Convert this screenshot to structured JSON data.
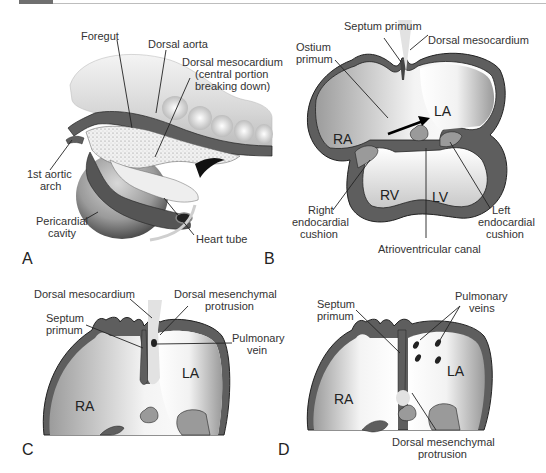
{
  "header": {
    "bar": "page-header-strip"
  },
  "colors": {
    "wall": "#5e5e5e",
    "wall_outline": "#222222",
    "cavity_light": "#ffffff",
    "cavity_shade": "#a8a8a8",
    "cushion": "#9a9a9a",
    "mesocardium": "#e2e2e2"
  },
  "panels": {
    "A": {
      "letter": "A",
      "labels": {
        "foregut": "Foregut",
        "dorsal_aorta": "Dorsal aorta",
        "dorsal_mesocardium_1": "Dorsal mesocardium",
        "dorsal_mesocardium_2": "(central portion",
        "dorsal_mesocardium_3": "breaking down)",
        "aortic_arch_1": "1st aortic",
        "aortic_arch_2": "arch",
        "pericardial_1": "Pericardial",
        "pericardial_2": "cavity",
        "heart_tube": "Heart tube"
      }
    },
    "B": {
      "letter": "B",
      "labels": {
        "septum_primum": "Septum primum",
        "dorsal_mesocardium": "Dorsal mesocardium",
        "ostium_1": "Ostium",
        "ostium_2": "primum",
        "ra": "RA",
        "la": "LA",
        "rv": "RV",
        "lv": "LV",
        "right_cushion_1": "Right",
        "right_cushion_2": "endocardial",
        "right_cushion_3": "cushion",
        "left_cushion_1": "Left",
        "left_cushion_2": "endocardial",
        "left_cushion_3": "cushion",
        "av_canal": "Atrioventricular canal"
      }
    },
    "C": {
      "letter": "C",
      "labels": {
        "dorsal_mesocardium": "Dorsal mesocardium",
        "mesenchymal_1": "Dorsal mesenchymal",
        "mesenchymal_2": "protrusion",
        "septum_1": "Septum",
        "septum_2": "primum",
        "pulmonary_1": "Pulmonary",
        "pulmonary_2": "vein",
        "ra": "RA",
        "la": "LA"
      }
    },
    "D": {
      "letter": "D",
      "labels": {
        "septum_1": "Septum",
        "septum_2": "primum",
        "pulmonary_1": "Pulmonary",
        "pulmonary_2": "veins",
        "ra": "RA",
        "la": "LA",
        "mesenchymal_1": "Dorsal mesenchymal",
        "mesenchymal_2": "protrusion"
      }
    }
  }
}
